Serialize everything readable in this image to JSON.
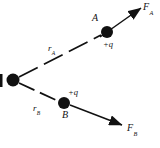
{
  "figure": {
    "type": "physics-force-diagram",
    "background_color": "#ffffff",
    "stroke_color": "#111111",
    "labels": {
      "point_a": "A",
      "point_b": "B",
      "charge_a": "+q",
      "charge_b": "+q",
      "distance_a_symbol": "r",
      "distance_a_sub": "A",
      "distance_b_symbol": "r",
      "distance_b_sub": "B",
      "force_a_symbol": "F",
      "force_a_sub": "A",
      "force_b_symbol": "F",
      "force_b_sub": "B"
    },
    "geometry": {
      "source_charge": {
        "cx": 13,
        "cy": 80,
        "r": 6.5
      },
      "charge_a": {
        "cx": 107,
        "cy": 32,
        "r": 6.0
      },
      "charge_b": {
        "cx": 64,
        "cy": 103,
        "r": 6.0
      },
      "dashed_line_a": {
        "x1": 19,
        "y1": 77,
        "x2": 101,
        "y2": 35
      },
      "dashed_line_b": {
        "x1": 19,
        "y1": 83,
        "x2": 58,
        "y2": 101
      },
      "arrow_a": {
        "x1": 100,
        "y1": 37,
        "x2": 145,
        "y2": 6
      },
      "arrow_b": {
        "x1": 70,
        "y1": 105,
        "x2": 126,
        "y2": 127
      },
      "edge_mark": {
        "x": 0,
        "y": 74,
        "w": 2.5,
        "h": 13
      }
    }
  }
}
